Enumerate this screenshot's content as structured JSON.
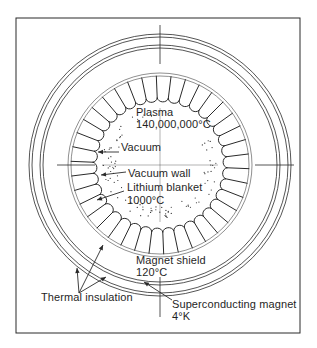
{
  "diagram": {
    "colors": {
      "ink": "#2a2a2a",
      "paper": "#ffffff"
    },
    "frame": {
      "x": 16,
      "y": 18,
      "w": 284,
      "h": 315
    },
    "center": {
      "x": 160,
      "y": 165
    },
    "rings": {
      "outer": [
        131,
        128
      ],
      "middle": [
        120,
        117
      ],
      "chamber": [
        92,
        89
      ]
    },
    "blanket": {
      "segments": 38,
      "outer_radius": 89,
      "inner_radius": 64
    },
    "labels": [
      {
        "id": "plasma",
        "text": "Plasma",
        "x": 136,
        "y": 112
      },
      {
        "id": "plasma-temp",
        "text": "140,000,000°C",
        "x": 136,
        "y": 124
      },
      {
        "id": "vacuum",
        "text": "Vacuum",
        "x": 121,
        "y": 147
      },
      {
        "id": "vacuum-wall",
        "text": "Vacuum wall",
        "x": 128,
        "y": 173
      },
      {
        "id": "lithium-blanket",
        "text": "Lithium blanket",
        "x": 127,
        "y": 187
      },
      {
        "id": "lithium-temp",
        "text": "1000°C",
        "x": 127,
        "y": 200
      },
      {
        "id": "magnet-shield",
        "text": "Magnet shield",
        "x": 136,
        "y": 260
      },
      {
        "id": "magnet-shield-temp",
        "text": "120°C",
        "x": 136,
        "y": 272
      },
      {
        "id": "thermal-insulation",
        "text": "Thermal insulation",
        "x": 41,
        "y": 297
      },
      {
        "id": "superconducting-magnet",
        "text": "Superconducting magnet",
        "x": 172,
        "y": 304
      },
      {
        "id": "magnet-temp",
        "text": "4°K",
        "x": 172,
        "y": 316
      }
    ]
  }
}
